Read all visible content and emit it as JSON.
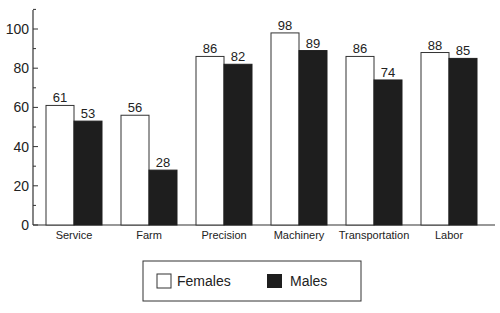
{
  "chart_data": {
    "type": "bar",
    "title": "",
    "xlabel": "",
    "ylabel": "",
    "ylim": [
      0,
      110
    ],
    "yticks": [
      0,
      20,
      40,
      60,
      80,
      100
    ],
    "grid": false,
    "legend_position": "bottom",
    "categories": [
      "Service",
      "Farm",
      "Precision",
      "Machinery",
      "Transportation",
      "Labor"
    ],
    "series": [
      {
        "name": "Females",
        "color": "#ffffff",
        "values": [
          61,
          56,
          86,
          98,
          86,
          88
        ]
      },
      {
        "name": "Males",
        "color": "#1e1e1e",
        "values": [
          53,
          28,
          82,
          89,
          74,
          85
        ]
      }
    ]
  },
  "legend": {
    "females_label": "Females",
    "males_label": "Males"
  }
}
